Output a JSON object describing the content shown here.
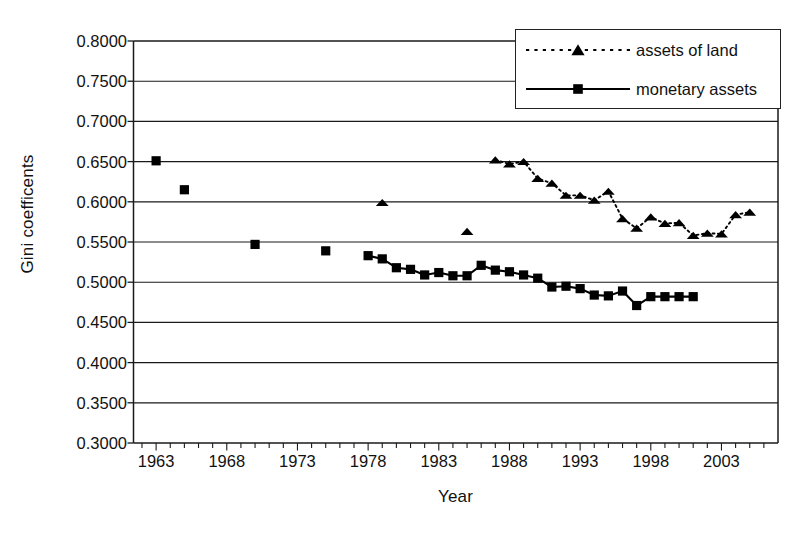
{
  "chart_data": {
    "type": "scatter",
    "title": "",
    "xlabel": "Year",
    "ylabel": "Gini coefficents",
    "xlim": [
      1961.4,
      2007.0
    ],
    "ylim": [
      0.3,
      0.8
    ],
    "grid": true,
    "y_major_step": 0.05,
    "x_major_step": 5,
    "x_minor_step": 1,
    "ytick_labels": [
      "0.8000",
      "0.7500",
      "0.7000",
      "0.6500",
      "0.6000",
      "0.5500",
      "0.5000",
      "0.4500",
      "0.4000",
      "0.3500",
      "0.3000"
    ],
    "ytick_values": [
      0.8,
      0.75,
      0.7,
      0.65,
      0.6,
      0.55,
      0.5,
      0.45,
      0.4,
      0.35,
      0.3
    ],
    "xtick_labels": [
      "1963",
      "1968",
      "1973",
      "1978",
      "1983",
      "1988",
      "1993",
      "1998",
      "2003"
    ],
    "xtick_values": [
      1963,
      1968,
      1973,
      1978,
      1983,
      1988,
      1993,
      1998,
      2003
    ],
    "legend_position": "top-right",
    "series": [
      {
        "name": "assets of land",
        "marker": "triangle",
        "linestyle": "dotted",
        "color": "#000000",
        "x": [
          1979,
          1985,
          1987,
          1988,
          1989,
          1990,
          1991,
          1992,
          1993,
          1994,
          1995,
          1996,
          1997,
          1998,
          1999,
          2000,
          2001,
          2002,
          2003,
          2004,
          2005
        ],
        "y": [
          0.599,
          0.563,
          0.652,
          0.647,
          0.65,
          0.629,
          0.623,
          0.608,
          0.608,
          0.602,
          0.613,
          0.579,
          0.567,
          0.581,
          0.573,
          0.574,
          0.558,
          0.561,
          0.56,
          0.584,
          0.587
        ]
      },
      {
        "name": "monetary assets",
        "marker": "square",
        "linestyle": "solid",
        "color": "#000000",
        "x": [
          1963,
          1965,
          1970,
          1975,
          1978,
          1979,
          1980,
          1981,
          1982,
          1983,
          1984,
          1985,
          1986,
          1987,
          1988,
          1989,
          1990,
          1991,
          1992,
          1993,
          1994,
          1995,
          1996,
          1997,
          1998,
          1999,
          2000,
          2001
        ],
        "y": [
          0.651,
          0.615,
          0.547,
          0.539,
          0.533,
          0.529,
          0.518,
          0.516,
          0.509,
          0.512,
          0.508,
          0.508,
          0.521,
          0.515,
          0.513,
          0.509,
          0.505,
          0.494,
          0.495,
          0.492,
          0.484,
          0.483,
          0.489,
          0.471,
          0.482,
          0.482,
          0.482,
          0.482
        ]
      }
    ]
  },
  "legend": {
    "items": [
      {
        "label": "assets of land"
      },
      {
        "label": "monetary assets"
      }
    ]
  },
  "axes": {
    "ylabel": "Gini coefficents",
    "xlabel": "Year"
  }
}
